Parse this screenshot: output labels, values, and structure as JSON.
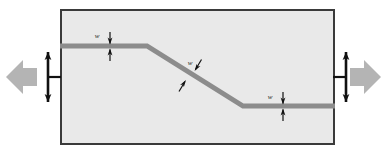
{
  "figure": {
    "name": "tensile-specimen-offset-band-diagram",
    "background_color": "#ffffff",
    "frame": {
      "name": "specimen-frame",
      "x": 60,
      "y": 9,
      "width": 275,
      "height": 136,
      "fill_color": "#e9e9e9",
      "border_color": "#3a3a3a",
      "border_width": 2
    },
    "band": {
      "name": "offset-shear-band",
      "color": "#8c8c8c",
      "thickness": 5,
      "points": [
        {
          "x": 60,
          "y": 46
        },
        {
          "x": 147,
          "y": 46
        },
        {
          "x": 243,
          "y": 106
        },
        {
          "x": 335,
          "y": 106
        }
      ]
    },
    "labels": [
      {
        "id": "width-left",
        "name": "band-width-label-left",
        "text": "w",
        "x": 97,
        "y": 38,
        "target_segment": "upper-horizontal"
      },
      {
        "id": "width-diagonal",
        "name": "band-width-label-diagonal",
        "text": "w",
        "x": 190,
        "y": 65,
        "target_segment": "diagonal"
      },
      {
        "id": "width-right",
        "name": "band-width-label-right",
        "text": "w",
        "x": 270,
        "y": 99,
        "target_segment": "lower-horizontal"
      }
    ],
    "dimension_arrows": [
      {
        "id": "dim-left",
        "name": "dimension-arrow-left",
        "orientation": "vertical",
        "x": 110,
        "y_top": 32,
        "y_bottom": 61,
        "gap_top": 44,
        "gap_bottom": 49,
        "color": "#111111"
      },
      {
        "id": "dim-diagonal",
        "name": "dimension-arrow-diagonal",
        "orientation": "perpendicular-to-diagonal",
        "x1": 199,
        "y1": 61,
        "x2": 181,
        "y2": 90,
        "color": "#111111"
      },
      {
        "id": "dim-right",
        "name": "dimension-arrow-right",
        "orientation": "vertical",
        "x": 283,
        "y_top": 92,
        "y_bottom": 121,
        "gap_top": 104,
        "gap_bottom": 109,
        "color": "#111111"
      }
    ],
    "load_arrows": [
      {
        "id": "load-left",
        "name": "load-arrow-left",
        "direction": "left",
        "color": "#b4b4b4",
        "tip_x": 6,
        "tail_x": 37,
        "center_y": 77,
        "shaft_half": 9,
        "head_half": 17
      },
      {
        "id": "load-right",
        "name": "load-arrow-right",
        "direction": "right",
        "color": "#b4b4b4",
        "tip_x": 381,
        "tail_x": 350,
        "center_y": 77,
        "shaft_half": 9,
        "head_half": 17
      }
    ],
    "grip_symbols": [
      {
        "id": "grip-left",
        "name": "grip-ibeam-left",
        "x": 48,
        "center_y": 77,
        "half_height": 25,
        "stem_length": 13,
        "stem_direction": "right",
        "color": "#111111"
      },
      {
        "id": "grip-right",
        "name": "grip-ibeam-right",
        "x": 346,
        "center_y": 77,
        "half_height": 25,
        "stem_length": 13,
        "stem_direction": "left",
        "color": "#111111"
      }
    ]
  }
}
